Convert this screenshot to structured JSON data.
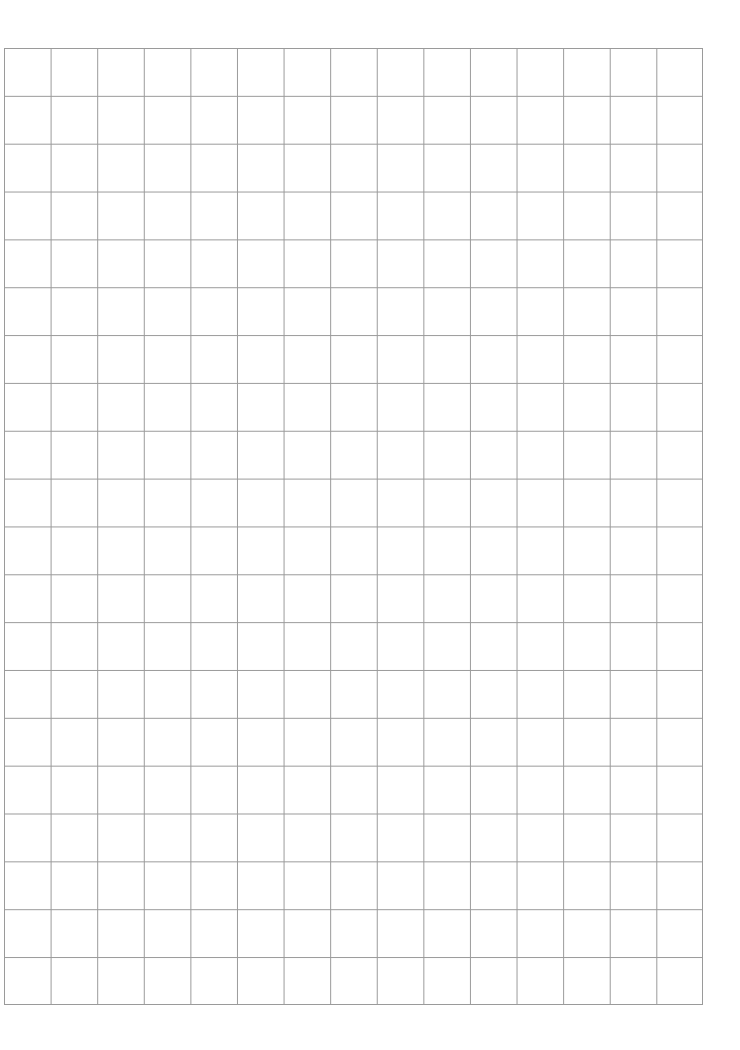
{
  "page": {
    "type": "grid-paper",
    "background_color": "#ffffff",
    "line_color": "#9a9a9a",
    "grid": {
      "columns": 15,
      "rows": 20
    }
  }
}
